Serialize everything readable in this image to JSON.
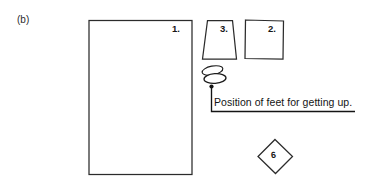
{
  "figure": {
    "panel_letter": "(b)",
    "caption_text": "Position of feet for getting up.",
    "background_color": "#ffffff",
    "ink_color": "#1a1a1a"
  },
  "shapes": [
    {
      "id": "bed-rectangle",
      "name": "rectangle-1",
      "label": "1.",
      "type": "rectangle",
      "stroke": "#2a2a2a"
    },
    {
      "id": "trapezoid-3",
      "name": "trapezoid-3",
      "label": "3.",
      "type": "trapezoid",
      "stroke": "#2a2a2a"
    },
    {
      "id": "quadrilateral-2",
      "name": "quadrilateral-2",
      "label": "2.",
      "type": "quadrilateral",
      "stroke": "#2a2a2a"
    },
    {
      "id": "diamond-6",
      "name": "diamond-6",
      "label": "6",
      "type": "diamond",
      "stroke": "#2a2a2a"
    },
    {
      "id": "feet-symbol",
      "name": "feet-ovals",
      "label": "",
      "type": "overlapping-ovals",
      "stroke": "#1c1c1c"
    }
  ],
  "annotation": {
    "leader_dot": "•",
    "text": "Position of feet for getting up."
  }
}
